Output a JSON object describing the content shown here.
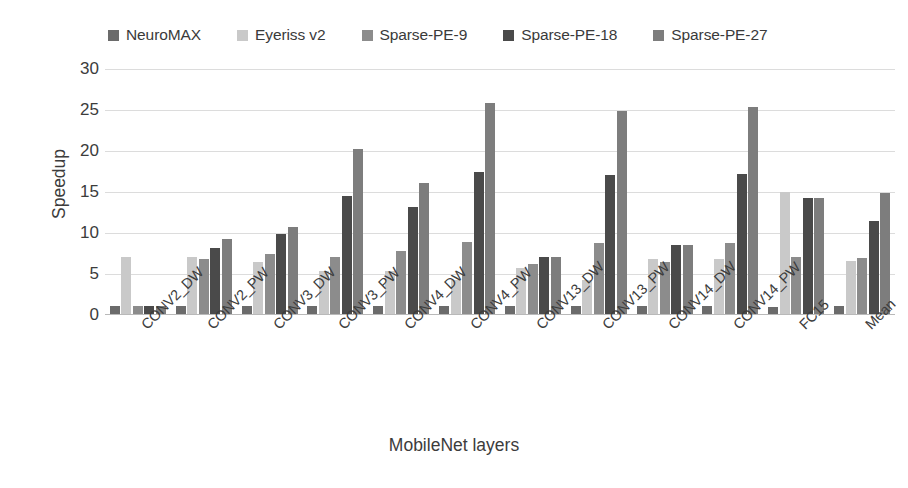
{
  "chart_data": {
    "type": "bar",
    "title": "",
    "xlabel": "MobileNet layers",
    "ylabel": "Speedup",
    "ylim": [
      0,
      30
    ],
    "yticks": [
      0,
      5,
      10,
      15,
      20,
      25,
      30
    ],
    "grid": true,
    "legend_position": "top",
    "categories": [
      "CONV2_DW",
      "CONV2_PW",
      "CONV3_DW",
      "CONV3_PW",
      "CONV4_DW",
      "CONV4_PW",
      "CONV13_DW",
      "CONV13_PW",
      "CONV14_DW",
      "CONV14_PW",
      "FC15",
      "Mean"
    ],
    "series": [
      {
        "name": "NeuroMAX",
        "color": "#6b6b6b",
        "values": [
          1.0,
          1.0,
          1.0,
          1.0,
          1.0,
          1.0,
          1.0,
          1.0,
          1.0,
          1.0,
          0.9,
          1.0
        ]
      },
      {
        "name": "Eyeriss v2",
        "color": "#c9c9c9",
        "values": [
          6.9,
          6.9,
          6.4,
          5.3,
          5.3,
          4.2,
          5.6,
          4.2,
          6.7,
          6.7,
          14.9,
          6.5
        ]
      },
      {
        "name": "Sparse-PE-9",
        "color": "#8c8c8c",
        "values": [
          1.0,
          6.7,
          7.3,
          7.0,
          7.7,
          8.8,
          6.1,
          8.6,
          6.3,
          8.6,
          7.0,
          6.8
        ]
      },
      {
        "name": "Sparse-PE-18",
        "color": "#4a4a4a",
        "values": [
          1.0,
          8.1,
          9.8,
          14.4,
          13.0,
          17.3,
          6.9,
          16.9,
          8.4,
          17.1,
          14.2,
          11.4
        ]
      },
      {
        "name": "Sparse-PE-27",
        "color": "#7d7d7d",
        "values": [
          1.0,
          9.2,
          10.6,
          20.1,
          16.0,
          25.7,
          6.9,
          24.8,
          8.4,
          25.3,
          14.2,
          14.7
        ]
      }
    ]
  },
  "legend": {
    "items": [
      {
        "label": "NeuroMAX",
        "color": "#6b6b6b"
      },
      {
        "label": "Eyeriss v2",
        "color": "#c9c9c9"
      },
      {
        "label": "Sparse-PE-9",
        "color": "#8c8c8c"
      },
      {
        "label": "Sparse-PE-18",
        "color": "#4a4a4a"
      },
      {
        "label": "Sparse-PE-27",
        "color": "#7d7d7d"
      }
    ]
  },
  "axes": {
    "y_title": "Speedup",
    "x_title": "MobileNet layers"
  }
}
